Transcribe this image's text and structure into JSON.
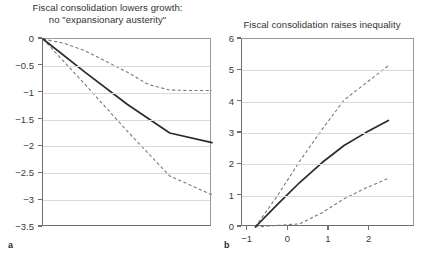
{
  "figure": {
    "panel_a_letter": "a",
    "panel_b_letter": "b"
  },
  "chart_data": [
    {
      "id": "panel-a",
      "type": "line",
      "title": "Fiscal consolidation lowers growth:",
      "subtitle": "no \"expansionary austerity\"",
      "panel_label": "a",
      "xlabel": "",
      "ylabel": "",
      "xlim": [
        -1,
        3
      ],
      "ylim": [
        -3.5,
        0
      ],
      "grid": true,
      "legend": "none",
      "xticks": [
        -1,
        0,
        1,
        2,
        3
      ],
      "xticklabels": [
        "",
        "",
        "",
        "",
        ""
      ],
      "yticks": [
        0,
        -0.5,
        -1,
        -1.5,
        -2,
        -2.5,
        -3,
        -3.5
      ],
      "yticklabels": [
        "0",
        "−0.5",
        "−1",
        "−1.5",
        "−2",
        "−2.5",
        "−3",
        "−3.5"
      ],
      "series": [
        {
          "name": "point estimate",
          "style": "solid",
          "color": "#2b2b2b",
          "x": [
            -1,
            0,
            1,
            2,
            3
          ],
          "values": [
            0,
            -0.62,
            -1.22,
            -1.75,
            -1.93
          ]
        },
        {
          "name": "upper confidence band",
          "style": "dashed",
          "color": "#7a7a7a",
          "x": [
            -1,
            -0.5,
            0,
            0.5,
            1,
            1.5,
            2,
            2.5,
            3
          ],
          "values": [
            0,
            -0.08,
            -0.22,
            -0.42,
            -0.62,
            -0.85,
            -0.95,
            -0.96,
            -0.96
          ]
        },
        {
          "name": "lower confidence band",
          "style": "dashed",
          "color": "#7a7a7a",
          "x": [
            -1,
            0,
            1,
            2,
            3
          ],
          "values": [
            0,
            -0.85,
            -1.72,
            -2.55,
            -2.9
          ]
        }
      ]
    },
    {
      "id": "panel-b",
      "type": "line",
      "title": "Fiscal consolidation raises inequality",
      "subtitle": "",
      "panel_label": "b",
      "xlabel": "",
      "ylabel": "",
      "xlim": [
        -1.3,
        2.6
      ],
      "ylim": [
        0,
        6
      ],
      "grid": true,
      "legend": "none",
      "xticks": [
        -1,
        0,
        1,
        2
      ],
      "xticklabels": [
        "−1",
        "0",
        "1",
        "2"
      ],
      "yticks": [
        0,
        1,
        2,
        3,
        4,
        5,
        6
      ],
      "yticklabels": [
        "0",
        "1",
        "2",
        "3",
        "4",
        "5",
        "6"
      ],
      "series": [
        {
          "name": "point estimate",
          "style": "solid",
          "color": "#2b2b2b",
          "x": [
            -1,
            -0.5,
            0,
            0.5,
            1,
            1.5,
            2
          ],
          "values": [
            0,
            0.72,
            1.42,
            2.05,
            2.6,
            3.02,
            3.4
          ]
        },
        {
          "name": "upper confidence band",
          "style": "dashed",
          "color": "#7a7a7a",
          "x": [
            -1,
            -0.5,
            0,
            0.5,
            1,
            1.5,
            2
          ],
          "values": [
            0,
            1.0,
            2.1,
            3.1,
            4.05,
            4.6,
            5.15
          ]
        },
        {
          "name": "lower confidence band",
          "style": "dashed",
          "color": "#7a7a7a",
          "x": [
            -1,
            -0.5,
            0,
            0.5,
            1,
            1.5,
            2
          ],
          "values": [
            0,
            0.05,
            0.1,
            0.45,
            0.9,
            1.25,
            1.55
          ]
        }
      ]
    }
  ]
}
